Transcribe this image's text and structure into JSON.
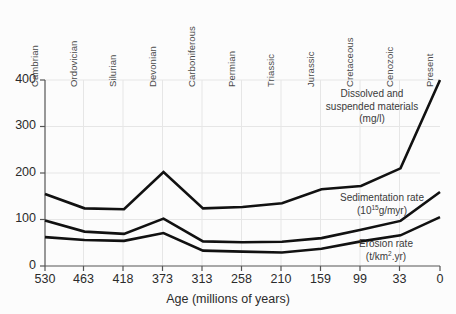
{
  "figure": {
    "background_color": "#fcfcfc",
    "line_color": "#111111",
    "grid_color": "#e4e4e4",
    "axis_color": "#555555"
  },
  "axes": {
    "x_title": "Age (millions of years)",
    "x_ticks": [
      "530",
      "463",
      "418",
      "373",
      "313",
      "258",
      "210",
      "159",
      "99",
      "33",
      "0"
    ],
    "y_ticks": [
      "400",
      "300",
      "200",
      "100",
      "0"
    ],
    "period_labels": [
      "Cambrian",
      "Ordovician",
      "Silurian",
      "Devonian",
      "Carboniferous",
      "Permian",
      "Triassic",
      "Jurassic",
      "Cretaceous",
      "Cenozoic",
      "Present"
    ]
  },
  "annotations": {
    "dissolved": {
      "line1": "Dissolved and",
      "line2": "suspended materials",
      "line3": "(mg/l)"
    },
    "sedimentation": {
      "line1": "Sedimentation rate",
      "unit_prefix": "(10",
      "unit_exponent": "15",
      "unit_suffix": "g/myr)"
    },
    "erosion": {
      "line1": "Erosion rate",
      "unit_prefix": "(t/km",
      "unit_exponent": "2",
      "unit_suffix": ".yr)"
    }
  },
  "chart_data": {
    "type": "line",
    "title": "",
    "xlabel": "Age (millions of years)",
    "ylabel": "",
    "xlim": [
      530,
      0
    ],
    "ylim": [
      0,
      400
    ],
    "grid": true,
    "legend_position": "inline-annotations",
    "x": [
      530,
      463,
      418,
      373,
      313,
      258,
      210,
      159,
      99,
      33,
      0
    ],
    "x_tick_labels": [
      "530",
      "463",
      "418",
      "373",
      "313",
      "258",
      "210",
      "159",
      "99",
      "33",
      "0"
    ],
    "secondary_x_labels": [
      "Cambrian",
      "Ordovician",
      "Silurian",
      "Devonian",
      "Carboniferous",
      "Permian",
      "Triassic",
      "Jurassic",
      "Cretaceous",
      "Cenozoic",
      "Present"
    ],
    "series": [
      {
        "name": "Dissolved and suspended materials (mg/l)",
        "values": [
          155,
          124,
          122,
          202,
          124,
          127,
          135,
          165,
          172,
          210,
          400
        ]
      },
      {
        "name": "Sedimentation rate (10^15 g/myr)",
        "values": [
          98,
          74,
          69,
          102,
          53,
          51,
          52,
          60,
          78,
          97,
          159
        ]
      },
      {
        "name": "Erosion rate (t/km2.yr)",
        "values": [
          62,
          56,
          54,
          71,
          33,
          31,
          29,
          37,
          53,
          66,
          105
        ]
      }
    ]
  }
}
